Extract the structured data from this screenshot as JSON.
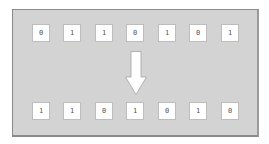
{
  "diagram": {
    "type": "bit-rotation",
    "colors": {
      "background": "#d3d3d3",
      "frame_border": "#8a8a8a",
      "bit_box": "#ffffff",
      "bit_text": "#555555",
      "arrow_fill": "#ffffff",
      "arrow_stroke": "#b0b0b0"
    },
    "input_row": {
      "bits": [
        "0",
        "1",
        "1",
        "0",
        "1",
        "0",
        "1"
      ]
    },
    "arrow": {
      "icon": "down-arrow-icon",
      "direction": "down"
    },
    "output_row": {
      "bits": [
        "1",
        "1",
        "0",
        "1",
        "0",
        "1",
        "0"
      ]
    }
  }
}
